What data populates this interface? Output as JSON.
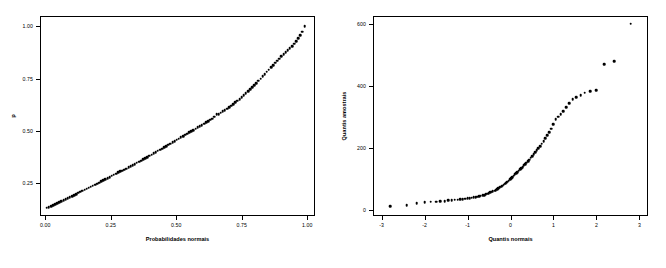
{
  "chart_data": [
    {
      "type": "scatter",
      "panel": "left",
      "title": "",
      "xlabel": "Probabilidades normais",
      "ylabel": "p",
      "xticks": [
        "0.00",
        "0.25",
        "0.50",
        "0.75",
        "1.00"
      ],
      "xtickvals": [
        0.0,
        0.25,
        0.5,
        0.75,
        1.0
      ],
      "yticks": [
        "0.25",
        "0.50",
        "0.75",
        "1.00"
      ],
      "ytickvals": [
        0.25,
        0.5,
        0.75,
        1.0
      ],
      "xlim": [
        -0.02,
        1.03
      ],
      "ylim": [
        0.09,
        1.05
      ],
      "grid": false,
      "legend": null,
      "marker_color": "#000000",
      "x": [
        0.006,
        0.014,
        0.022,
        0.03,
        0.038,
        0.046,
        0.054,
        0.062,
        0.07,
        0.078,
        0.086,
        0.094,
        0.102,
        0.11,
        0.118,
        0.126,
        0.134,
        0.142,
        0.15,
        0.158,
        0.166,
        0.174,
        0.182,
        0.19,
        0.198,
        0.206,
        0.214,
        0.222,
        0.23,
        0.238,
        0.246,
        0.254,
        0.262,
        0.27,
        0.278,
        0.286,
        0.294,
        0.302,
        0.31,
        0.318,
        0.326,
        0.334,
        0.342,
        0.35,
        0.358,
        0.366,
        0.374,
        0.382,
        0.39,
        0.398,
        0.406,
        0.414,
        0.422,
        0.43,
        0.438,
        0.446,
        0.454,
        0.462,
        0.47,
        0.478,
        0.486,
        0.494,
        0.502,
        0.51,
        0.518,
        0.526,
        0.534,
        0.542,
        0.55,
        0.558,
        0.566,
        0.574,
        0.582,
        0.59,
        0.598,
        0.606,
        0.614,
        0.622,
        0.63,
        0.638,
        0.646,
        0.654,
        0.662,
        0.67,
        0.678,
        0.686,
        0.694,
        0.702,
        0.71,
        0.718,
        0.726,
        0.734,
        0.742,
        0.75,
        0.758,
        0.766,
        0.774,
        0.782,
        0.79,
        0.798,
        0.806,
        0.814,
        0.822,
        0.83,
        0.838,
        0.846,
        0.854,
        0.862,
        0.87,
        0.878,
        0.886,
        0.894,
        0.902,
        0.91,
        0.918,
        0.926,
        0.934,
        0.942,
        0.95,
        0.958,
        0.966,
        0.974,
        0.982,
        0.99
      ],
      "y": [
        0.13,
        0.133,
        0.138,
        0.142,
        0.148,
        0.152,
        0.157,
        0.162,
        0.167,
        0.172,
        0.176,
        0.181,
        0.186,
        0.191,
        0.196,
        0.201,
        0.206,
        0.211,
        0.216,
        0.221,
        0.226,
        0.231,
        0.236,
        0.241,
        0.245,
        0.25,
        0.256,
        0.261,
        0.266,
        0.272,
        0.277,
        0.283,
        0.288,
        0.293,
        0.299,
        0.304,
        0.308,
        0.313,
        0.318,
        0.323,
        0.329,
        0.334,
        0.34,
        0.345,
        0.351,
        0.356,
        0.362,
        0.368,
        0.373,
        0.379,
        0.385,
        0.391,
        0.397,
        0.403,
        0.409,
        0.414,
        0.42,
        0.426,
        0.432,
        0.438,
        0.444,
        0.45,
        0.456,
        0.462,
        0.468,
        0.474,
        0.48,
        0.486,
        0.492,
        0.497,
        0.503,
        0.509,
        0.515,
        0.521,
        0.527,
        0.533,
        0.539,
        0.545,
        0.552,
        0.558,
        0.566,
        0.578,
        0.58,
        0.586,
        0.592,
        0.598,
        0.605,
        0.612,
        0.62,
        0.628,
        0.636,
        0.644,
        0.652,
        0.661,
        0.67,
        0.679,
        0.689,
        0.698,
        0.708,
        0.718,
        0.728,
        0.739,
        0.75,
        0.761,
        0.772,
        0.783,
        0.793,
        0.803,
        0.814,
        0.825,
        0.836,
        0.846,
        0.856,
        0.866,
        0.876,
        0.886,
        0.896,
        0.906,
        0.918,
        0.93,
        0.943,
        0.958,
        0.975,
        1.0
      ]
    },
    {
      "type": "scatter",
      "panel": "right",
      "title": "",
      "xlabel": "Quantis normais",
      "ylabel": "Quantis amostrais",
      "xticks": [
        "-3",
        "-2",
        "-1",
        "0",
        "1",
        "2",
        "3"
      ],
      "xtickvals": [
        -3,
        -2,
        -1,
        0,
        1,
        2,
        3
      ],
      "yticks": [
        "0",
        "200",
        "400",
        "600"
      ],
      "ytickvals": [
        0,
        200,
        400,
        600
      ],
      "xlim": [
        -3.2,
        3.2
      ],
      "ylim": [
        -20,
        625
      ],
      "grid": false,
      "legend": null,
      "marker_color": "#000000",
      "x": [
        -2.8,
        -2.42,
        -2.18,
        -2.0,
        -1.86,
        -1.73,
        -1.63,
        -1.53,
        -1.45,
        -1.37,
        -1.3,
        -1.23,
        -1.17,
        -1.11,
        -1.05,
        -1.0,
        -0.95,
        -0.9,
        -0.86,
        -0.81,
        -0.77,
        -0.73,
        -0.69,
        -0.65,
        -0.61,
        -0.58,
        -0.54,
        -0.51,
        -0.47,
        -0.44,
        -0.41,
        -0.37,
        -0.34,
        -0.31,
        -0.28,
        -0.25,
        -0.22,
        -0.19,
        -0.16,
        -0.13,
        -0.1,
        -0.07,
        -0.04,
        -0.01,
        0.01,
        0.04,
        0.07,
        0.1,
        0.13,
        0.16,
        0.19,
        0.22,
        0.25,
        0.28,
        0.31,
        0.34,
        0.37,
        0.41,
        0.44,
        0.47,
        0.51,
        0.54,
        0.58,
        0.61,
        0.65,
        0.69,
        0.73,
        0.77,
        0.81,
        0.86,
        0.9,
        0.95,
        1.0,
        1.05,
        1.11,
        1.17,
        1.23,
        1.3,
        1.37,
        1.45,
        1.53,
        1.63,
        1.73,
        1.86,
        2.0,
        2.18,
        2.42,
        2.8
      ],
      "y": [
        12,
        14,
        22,
        24,
        26,
        26,
        28,
        28,
        30,
        30,
        32,
        32,
        34,
        35,
        36,
        37,
        38,
        39,
        40,
        41,
        42,
        44,
        45,
        47,
        48,
        50,
        52,
        54,
        56,
        58,
        60,
        62,
        64,
        66,
        69,
        72,
        75,
        78,
        81,
        84,
        87,
        90,
        94,
        98,
        102,
        106,
        110,
        114,
        118,
        122,
        126,
        130,
        134,
        138,
        143,
        148,
        152,
        157,
        162,
        168,
        173,
        179,
        185,
        192,
        198,
        205,
        213,
        221,
        230,
        240,
        250,
        262,
        276,
        292,
        300,
        308,
        318,
        330,
        344,
        356,
        364,
        370,
        378,
        382,
        386,
        470,
        480,
        600
      ]
    }
  ]
}
